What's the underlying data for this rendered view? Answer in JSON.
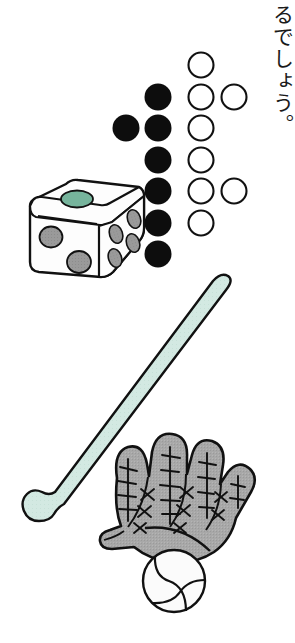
{
  "page": {
    "width": 295,
    "height": 643,
    "background": "#ffffff",
    "illustration_name": "baseball-equipment-and-counting-circles"
  },
  "caption": {
    "text": "るでしょう。",
    "orientation": "vertical-rtl",
    "color": "#1a1a1a"
  },
  "colors": {
    "outline": "#111111",
    "filled_circle": "#0d0d0d",
    "empty_circle_fill": "#ffffff",
    "die_body": "#fdfdfd",
    "die_pip_gray": "#9a9a9a",
    "die_pip_green": "#76b49c",
    "bat_body": "#d3e9e2",
    "glove_body": "#a8a8a8",
    "ball_body": "#fbfbfb"
  },
  "counting_diagram": {
    "name": "counting-circles-diagram",
    "filled_count": 7,
    "empty_count": 8,
    "total_count": 15,
    "radius": 13.5,
    "filled_circles": [
      {
        "id": "filled-1",
        "cx": 126,
        "cy": 128
      },
      {
        "id": "filled-2",
        "cx": 158,
        "cy": 97
      },
      {
        "id": "filled-3",
        "cx": 158,
        "cy": 128
      },
      {
        "id": "filled-4",
        "cx": 158,
        "cy": 160
      },
      {
        "id": "filled-5",
        "cx": 158,
        "cy": 191
      },
      {
        "id": "filled-6",
        "cx": 158,
        "cy": 223
      },
      {
        "id": "filled-7",
        "cx": 158,
        "cy": 254
      }
    ],
    "empty_circles": [
      {
        "id": "empty-1",
        "cx": 201,
        "cy": 65
      },
      {
        "id": "empty-2",
        "cx": 201,
        "cy": 97
      },
      {
        "id": "empty-3",
        "cx": 234,
        "cy": 97
      },
      {
        "id": "empty-4",
        "cx": 201,
        "cy": 128
      },
      {
        "id": "empty-5",
        "cx": 201,
        "cy": 160
      },
      {
        "id": "empty-6",
        "cx": 201,
        "cy": 191
      },
      {
        "id": "empty-7",
        "cx": 234,
        "cy": 191
      },
      {
        "id": "empty-8",
        "cx": 201,
        "cy": 223
      }
    ]
  },
  "objects": {
    "die": {
      "name": "die",
      "label": "die",
      "top_face_pips": 1,
      "front_face_pips": 2,
      "right_face_pips": 4,
      "top_pip_color": "#76b49c",
      "side_pip_color": "#9a9a9a"
    },
    "bat": {
      "name": "baseball-bat",
      "label": "baseball bat",
      "color": "#d3e9e2",
      "angle_description": "diagonal-upper-right-to-lower-left"
    },
    "glove": {
      "name": "baseball-glove",
      "label": "baseball glove",
      "color": "#a8a8a8",
      "finger_count": 4,
      "lacing": "cross-stitch"
    },
    "ball": {
      "name": "baseball",
      "label": "baseball",
      "color": "#fbfbfb",
      "seam_count": 2
    }
  }
}
